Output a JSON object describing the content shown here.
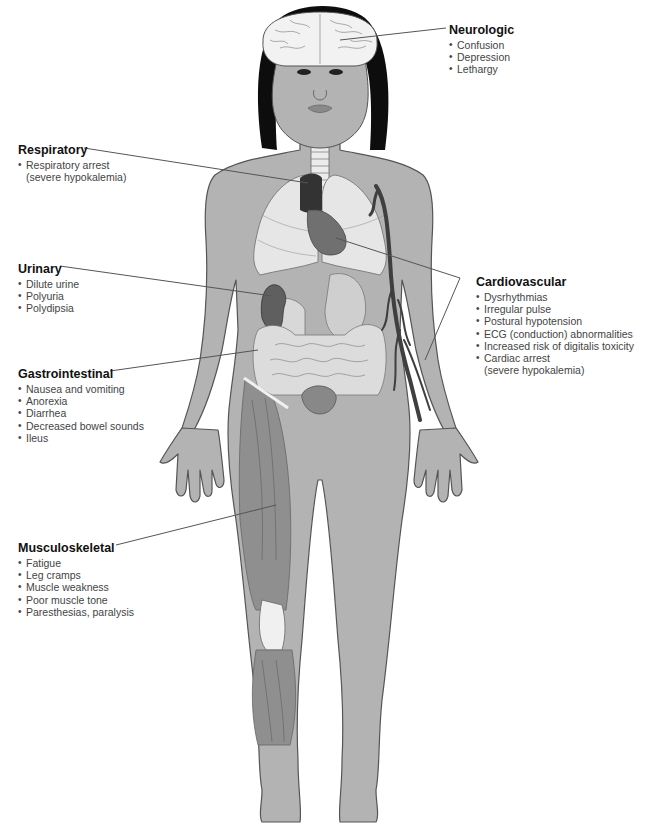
{
  "figure": {
    "colors": {
      "skin": "#b3b3b3",
      "skin_outline": "#555555",
      "hair": "#0d0d0d",
      "brain": "#f2f2f2",
      "lungs": "#e6e6e6",
      "heart": "#707070",
      "heart_dark": "#333333",
      "kidney": "#5f5f5f",
      "intestines": "#dcdcdc",
      "muscle": "#8f8f8f",
      "tendon": "#f0f0f0",
      "veins": "#3f3f3f",
      "leader_line": "#555555",
      "title_text": "#111111",
      "body_text": "#444444"
    }
  },
  "labels": {
    "neurologic": {
      "title": "Neurologic",
      "items": [
        "Confusion",
        "Depression",
        "Lethargy"
      ]
    },
    "respiratory": {
      "title": "Respiratory",
      "items": [
        {
          "text": "Respiratory arrest",
          "cont": "(severe hypokalemia)"
        }
      ]
    },
    "urinary": {
      "title": "Urinary",
      "items": [
        "Dilute urine",
        "Polyuria",
        "Polydipsia"
      ]
    },
    "gastrointestinal": {
      "title": "Gastrointestinal",
      "items": [
        "Nausea and vomiting",
        "Anorexia",
        "Diarrhea",
        "Decreased bowel sounds",
        "Ileus"
      ]
    },
    "musculoskeletal": {
      "title": "Musculoskeletal",
      "items": [
        "Fatigue",
        "Leg cramps",
        "Muscle weakness",
        "Poor muscle tone",
        "Paresthesias, paralysis"
      ]
    },
    "cardiovascular": {
      "title": "Cardiovascular",
      "items": [
        "Dysrhythmias",
        "Irregular pulse",
        "Postural hypotension",
        "ECG (conduction) abnormalities",
        "Increased risk of digitalis toxicity",
        {
          "text": "Cardiac arrest",
          "cont": "(severe hypokalemia)"
        }
      ]
    }
  },
  "bullet_glyph": "•"
}
